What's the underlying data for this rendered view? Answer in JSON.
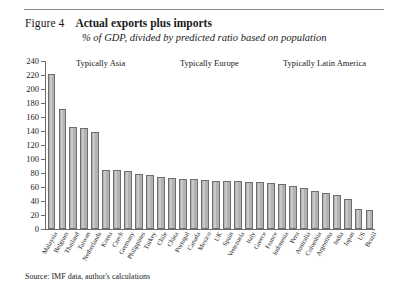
{
  "figure": {
    "label": "Figure 4",
    "title": "Actual exports plus imports",
    "subtitle": "% of GDP, divided by predicted ratio based on population",
    "source": "Source: IMF data, author's calculations"
  },
  "groups": [
    {
      "name": "asia",
      "label": "Typically Asia"
    },
    {
      "name": "europe",
      "label": "Typically Europe"
    },
    {
      "name": "latam",
      "label": "Typically Latin America"
    }
  ],
  "colors": {
    "bar_fill": "#b2b2b2",
    "bar_stroke": "#6e6e6e",
    "bar_highlight": "#c9c9c9",
    "axis": "#6b6b6b",
    "rule": "#8a8a8a",
    "text": "#1a1a1a"
  },
  "chart_data": {
    "type": "bar",
    "title": "Actual exports plus imports",
    "subtitle": "% of GDP, divided by predicted ratio based on population",
    "xlabel": "",
    "ylabel": "",
    "ylim": [
      0,
      240
    ],
    "yticks": [
      0,
      20,
      40,
      60,
      80,
      100,
      120,
      140,
      160,
      180,
      200,
      220,
      240
    ],
    "grid": false,
    "legend": null,
    "annotations": [
      "Typically Asia",
      "Typically Europe",
      "Typically Latin America"
    ],
    "categories": [
      "Malaysia",
      "Belgium",
      "Thailand",
      "Taiwan",
      "Netherlands",
      "Korea",
      "Czech",
      "Germany",
      "Philippines",
      "Turkey",
      "Chile",
      "China",
      "Portugal",
      "Canada",
      "Mexico",
      "UK",
      "Spain",
      "Venezuela",
      "Italy",
      "Greece",
      "France",
      "Indonesia",
      "Peru",
      "Australia",
      "Colombia",
      "Argentina",
      "India",
      "Japan",
      "US",
      "Brazil"
    ],
    "values": [
      221,
      172,
      146,
      145,
      138,
      85,
      84,
      83,
      78,
      77,
      75,
      73,
      72,
      71,
      70,
      69,
      68,
      68,
      67,
      67,
      66,
      64,
      62,
      58,
      55,
      52,
      48,
      43,
      29,
      27
    ]
  }
}
